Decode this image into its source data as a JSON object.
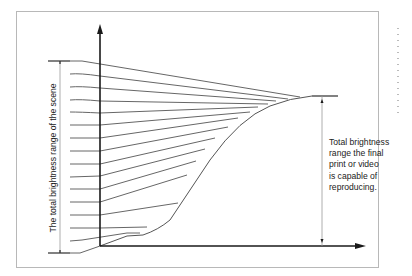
{
  "diagram": {
    "left_label": "The total brightness range of the scene",
    "right_label_lines": [
      "Total brightness",
      "range the final",
      "print or video",
      "is capable of",
      "reproducing."
    ],
    "colors": {
      "frame": "#b8b8b8",
      "axis": "#1a1a1a",
      "lines": "#555555",
      "background": "#ffffff"
    },
    "scene_lines_count": 16,
    "curve_description": "S-shaped characteristic curve rising from origin, steep mid-section, flattening at top"
  }
}
